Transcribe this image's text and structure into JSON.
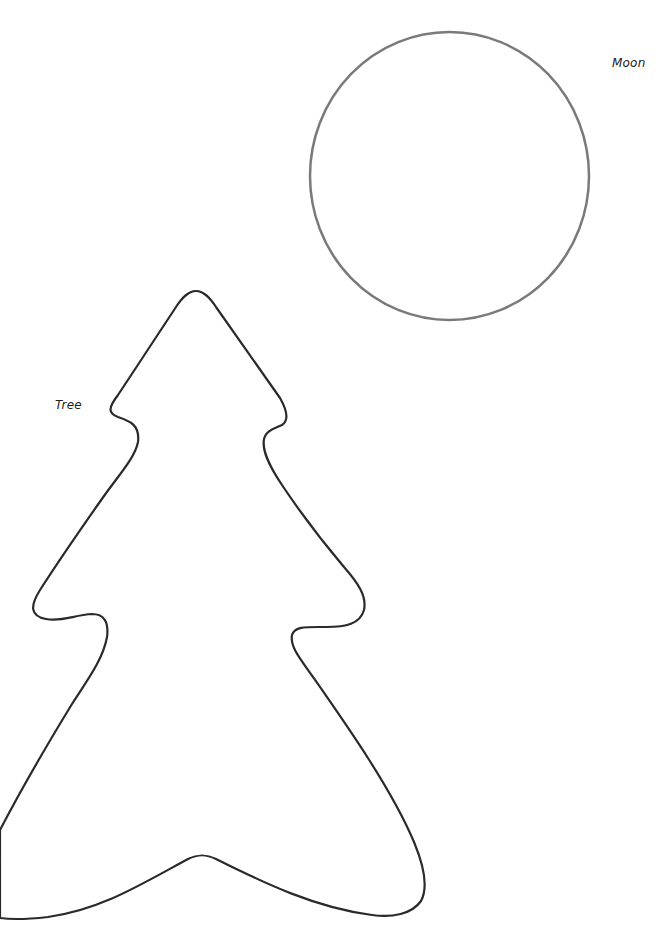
{
  "labels": {
    "moon": "Moon",
    "tree": "Tree"
  },
  "shapes": {
    "moon": {
      "type": "circle-outline",
      "cx": 449.5,
      "cy": 176,
      "rx": 139.5,
      "ry": 144,
      "stroke": "#7a7a7a",
      "stroke_width": 2.5
    },
    "tree": {
      "type": "tree-outline",
      "stroke": "#2a2a2a",
      "stroke_width": 2.2
    }
  },
  "colors": {
    "background": "#ffffff",
    "text": "#222222"
  }
}
